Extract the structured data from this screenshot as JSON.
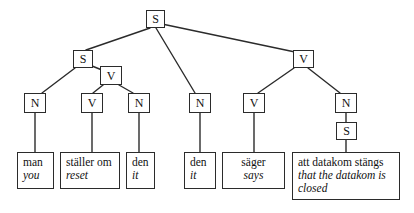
{
  "figure": {
    "type": "syntactic-tree-diagram",
    "background_color": "#ffffff",
    "line_color": "#2b2b2b",
    "text_color": "#111111"
  },
  "nodes": {
    "root_s": "S",
    "left_s": "S",
    "left_v": "V",
    "right_v": "V",
    "n1": "N",
    "v1": "V",
    "n2": "N",
    "n3": "N",
    "v2": "V",
    "n4": "N",
    "embedded_s": "S"
  },
  "leaves": [
    {
      "id": "leaf-man",
      "source": "man",
      "gloss": "you"
    },
    {
      "id": "leaf-stall",
      "source": "ställer om",
      "gloss": "reset"
    },
    {
      "id": "leaf-den1",
      "source": "den",
      "gloss": "it"
    },
    {
      "id": "leaf-den2",
      "source": "den",
      "gloss": "it"
    },
    {
      "id": "leaf-sager",
      "source": "säger",
      "gloss": "says"
    },
    {
      "id": "leaf-att",
      "source": "att datakom stängs",
      "gloss": "that the datakom is closed"
    }
  ]
}
